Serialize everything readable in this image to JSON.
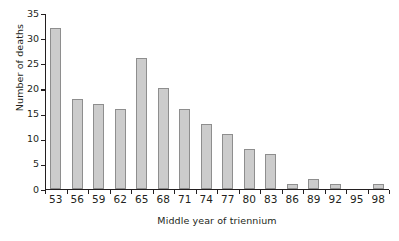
{
  "chart_data": {
    "type": "bar",
    "title": "",
    "xlabel": "Middle year of triennium",
    "ylabel": "Number of deaths",
    "categories": [
      "53",
      "56",
      "59",
      "62",
      "65",
      "68",
      "71",
      "74",
      "77",
      "80",
      "83",
      "86",
      "89",
      "92",
      "95",
      "98"
    ],
    "values": [
      32,
      18,
      17,
      16,
      26,
      20,
      16,
      13,
      11,
      8,
      7,
      1,
      2,
      1,
      0,
      1
    ],
    "ylim": [
      0,
      35
    ],
    "yticks": [
      "0",
      "5",
      "10",
      "15",
      "20",
      "25",
      "30",
      "35"
    ],
    "ytick_values": [
      0,
      5,
      10,
      15,
      20,
      25,
      30,
      35
    ],
    "grid": false,
    "legend": false,
    "colors": {
      "bar_fill": "#cccccc",
      "bar_stroke": "#8e8e8e",
      "axis": "#231f20",
      "background": "#ffffff"
    }
  }
}
